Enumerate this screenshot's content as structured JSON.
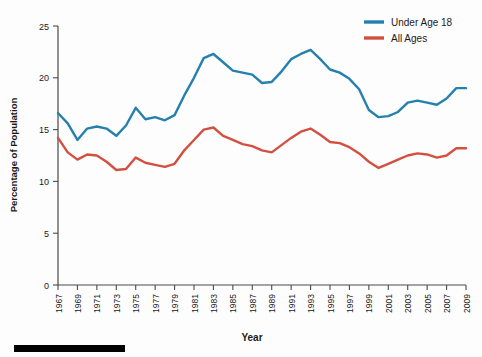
{
  "chart_data": {
    "type": "line",
    "title": "",
    "xlabel": "Year",
    "ylabel": "Percentage of Population",
    "xlim": [
      1967,
      2009
    ],
    "ylim": [
      0,
      25
    ],
    "yticks": [
      0,
      5,
      10,
      15,
      20,
      25
    ],
    "ytick_labels": [
      "0",
      "5",
      "10",
      "15",
      "20",
      "25"
    ],
    "grid": false,
    "legend_position": "top-right",
    "x": [
      1967,
      1968,
      1969,
      1970,
      1971,
      1972,
      1973,
      1974,
      1975,
      1976,
      1977,
      1978,
      1979,
      1980,
      1981,
      1982,
      1983,
      1984,
      1985,
      1986,
      1987,
      1988,
      1989,
      1990,
      1991,
      1992,
      1993,
      1994,
      1995,
      1996,
      1997,
      1998,
      1999,
      2000,
      2001,
      2002,
      2003,
      2004,
      2005,
      2006,
      2007,
      2008,
      2009
    ],
    "xtick_labels": [
      "1967",
      "1969",
      "1971",
      "1973",
      "1975",
      "1977",
      "1979",
      "1981",
      "1983",
      "1985",
      "1987",
      "1989",
      "1991",
      "1993",
      "1995",
      "1997",
      "1999",
      "2001",
      "2003",
      "2005",
      "2007",
      "2009"
    ],
    "series": [
      {
        "name": "Under Age 18",
        "color": "#2580ae",
        "values": [
          16.6,
          15.6,
          14.0,
          15.1,
          15.3,
          15.1,
          14.4,
          15.4,
          17.1,
          16.0,
          16.2,
          15.9,
          16.4,
          18.3,
          20.0,
          21.9,
          22.3,
          21.5,
          20.7,
          20.5,
          20.3,
          19.5,
          19.6,
          20.6,
          21.8,
          22.3,
          22.7,
          21.8,
          20.8,
          20.5,
          19.9,
          18.9,
          16.9,
          16.2,
          16.3,
          16.7,
          17.6,
          17.8,
          17.6,
          17.4,
          18.0,
          19.0,
          19.0
        ]
      },
      {
        "name": "All Ages",
        "color": "#d35040",
        "values": [
          14.2,
          12.8,
          12.1,
          12.6,
          12.5,
          11.9,
          11.1,
          11.2,
          12.3,
          11.8,
          11.6,
          11.4,
          11.7,
          13.0,
          14.0,
          15.0,
          15.2,
          14.4,
          14.0,
          13.6,
          13.4,
          13.0,
          12.8,
          13.5,
          14.2,
          14.8,
          15.1,
          14.5,
          13.8,
          13.7,
          13.3,
          12.7,
          11.9,
          11.3,
          11.7,
          12.1,
          12.5,
          12.7,
          12.6,
          12.3,
          12.5,
          13.2,
          13.2
        ]
      }
    ]
  },
  "legend": {
    "items": [
      {
        "label": "Under Age 18",
        "color": "#2580ae"
      },
      {
        "label": "All Ages",
        "color": "#d35040"
      }
    ]
  },
  "axis": {
    "y_title": "Percentage of Population",
    "x_title": "Year"
  },
  "scale_bar": {
    "present": true
  }
}
